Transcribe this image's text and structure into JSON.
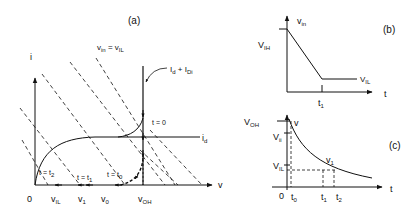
{
  "panel_a": {
    "label": "(a)",
    "y_axis": "i",
    "x_axis": "v",
    "load_line_label": "v_in = v_IL",
    "load_line_main": "v",
    "load_line_sub1": "in",
    "load_line_eq": " = v",
    "load_line_sub2": "IL",
    "current_label_main": "I",
    "current_label_sub1": "d",
    "current_label_plus": " + I",
    "current_label_sub2": "Di",
    "curve_label_main": "i",
    "curve_label_sub": "d",
    "t_zero": "t = 0",
    "t_t0_main": "t = t",
    "t_t0_sub": "0",
    "t_t1_main": "t = t",
    "t_t1_sub": "1",
    "t_t2_main": "t = t",
    "t_t2_sub": "2",
    "x_ticks": [
      {
        "main": "0",
        "sub": ""
      },
      {
        "main": "v",
        "sub": "IL"
      },
      {
        "main": "v",
        "sub": "1"
      },
      {
        "main": "v",
        "sub": "0"
      },
      {
        "main": "v",
        "sub": "OH"
      }
    ]
  },
  "panel_b": {
    "label": "(b)",
    "y_main": "v",
    "y_sub": "in",
    "vih_main": "V",
    "vih_sub": "IH",
    "vil_main": "V",
    "vil_sub": "IL",
    "t1_main": "t",
    "t1_sub": "1",
    "x_axis": "t"
  },
  "panel_c": {
    "label": "(c)",
    "y_axis": "v",
    "voh_main": "V",
    "voh_sub": "OH",
    "vii_main": "V",
    "vii_sub": "ii",
    "vil_main": "V",
    "vil_sub": "IL",
    "v1_main": "v",
    "v1_sub": "1",
    "origin": "0",
    "t0_main": "t",
    "t0_sub": "0",
    "t1_main": "t",
    "t1_sub": "1",
    "t2_main": "t",
    "t2_sub": "2",
    "x_axis": "t"
  }
}
